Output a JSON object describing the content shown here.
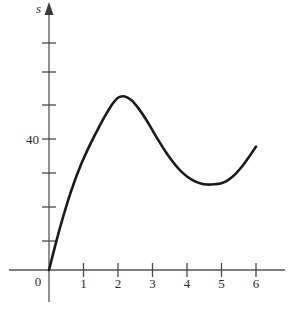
{
  "chart_data": {
    "type": "line",
    "title": "",
    "subtitle": "",
    "xlabel": "",
    "ylabel": "s",
    "axis_label_y": "s",
    "origin_label": "0",
    "x_tick_labels": [
      "1",
      "2",
      "3",
      "4",
      "5",
      "6"
    ],
    "x_ticks": [
      1,
      2,
      3,
      4,
      5,
      6
    ],
    "y_tick_labels": [
      "40"
    ],
    "y_ticks_labeled": [
      40
    ],
    "y_ticks_all": [
      10,
      20,
      30,
      40,
      50,
      60,
      70,
      80
    ],
    "xlim": [
      0,
      6.5
    ],
    "ylim": [
      0,
      82
    ],
    "grid": false,
    "legend": null,
    "curve_color": "#1a1a1a",
    "axis_color": "#555555",
    "series": [
      {
        "name": "s(t)",
        "x": [
          0,
          0.1,
          0.2,
          0.3,
          0.4,
          0.5,
          0.6,
          0.7,
          0.8,
          0.9,
          1.0,
          1.2,
          1.4,
          1.6,
          1.8,
          2.0,
          2.2,
          2.4,
          2.6,
          2.8,
          3.0,
          3.2,
          3.4,
          3.6,
          3.8,
          4.0,
          4.2,
          4.4,
          4.6,
          4.8,
          5.0,
          5.2,
          5.4,
          5.6,
          5.8,
          6.0
        ],
        "values": [
          0,
          4.0,
          8.0,
          11.8,
          15.4,
          18.8,
          22.0,
          25.0,
          27.8,
          30.4,
          32.8,
          37.2,
          41.2,
          45.0,
          48.4,
          50.8,
          51.2,
          50.0,
          47.6,
          44.6,
          41.2,
          37.8,
          34.6,
          31.8,
          29.4,
          27.6,
          26.3,
          25.5,
          25.2,
          25.3,
          25.6,
          26.6,
          28.3,
          30.6,
          33.4,
          36.4
        ]
      }
    ],
    "annotations": {
      "local_max": {
        "x": 2.0,
        "y": 51.5,
        "label": ""
      },
      "local_min": {
        "x": 4.7,
        "y": 25.2,
        "label": ""
      },
      "start": {
        "x": 0,
        "y": 0,
        "label": ""
      },
      "end": {
        "x": 6.0,
        "y": 36.4,
        "label": ""
      }
    }
  }
}
